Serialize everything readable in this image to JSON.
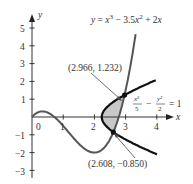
{
  "figure": {
    "type": "diagram",
    "colors": {
      "axis": "#333333",
      "cubic": "#555555",
      "hyperbola": "#111111",
      "shade": "#c8c8c8",
      "text": "#333333"
    },
    "axes": {
      "x_label": "x",
      "y_label": "y",
      "x_ticks": [
        "0",
        "1",
        "2",
        "3",
        "4"
      ],
      "y_ticks": [
        "5",
        "4",
        "3",
        "2",
        "1",
        "−1",
        "−2",
        "−3"
      ]
    },
    "curves": {
      "cubic_label": "y = x³ − 3.5x² + 2x",
      "cubic_label_parts": {
        "y": "y",
        "eq": " = ",
        "x1": "x",
        "p1": "3",
        "m": " − 3.5",
        "x2": "x",
        "p2": "2",
        "plus": " + 2",
        "x3": "x"
      },
      "hyperbola_label": {
        "num1": "x²",
        "den1": "5",
        "minus": "−",
        "num2": "y²",
        "den2": "2",
        "rhs": "= 1"
      }
    },
    "points": [
      {
        "label": "(2.966, 1.232)",
        "x": 2.966,
        "y": 1.232
      },
      {
        "label": "(2.608, −0.850)",
        "x": 2.608,
        "y": -0.85
      }
    ]
  },
  "chart_data": {
    "type": "line",
    "title": "",
    "xlabel": "x",
    "ylabel": "y",
    "xlim": [
      0,
      4.5
    ],
    "ylim": [
      -3,
      5.5
    ],
    "x_ticks": [
      0,
      1,
      2,
      3,
      4
    ],
    "y_ticks": [
      -3,
      -2,
      -1,
      1,
      2,
      3,
      4,
      5
    ],
    "series": [
      {
        "name": "y = x^3 - 3.5x^2 + 2x",
        "kind": "cubic"
      },
      {
        "name": "x^2/5 - y^2/2 = 1",
        "kind": "hyperbola (right branch)"
      }
    ],
    "intersections": [
      {
        "x": 2.966,
        "y": 1.232,
        "label": "(2.966, 1.232)"
      },
      {
        "x": 2.608,
        "y": -0.85,
        "label": "(2.608, −0.850)"
      }
    ],
    "shaded_region": "Region bounded between the hyperbola branch and the cubic between the two intersection points",
    "grid": false
  }
}
